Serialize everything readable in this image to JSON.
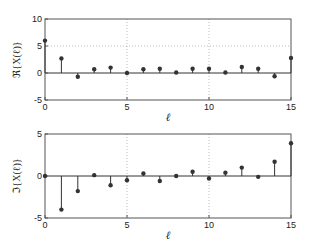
{
  "chart_data": [
    {
      "type": "stem",
      "title": "",
      "xlabel": "ℓ",
      "ylabel": "ℜ{X(ℓ)}",
      "xlim": [
        0,
        15
      ],
      "ylim": [
        -5,
        10
      ],
      "xticks": [
        0,
        5,
        10,
        15
      ],
      "yticks": [
        -5,
        0,
        5,
        10
      ],
      "grid": true,
      "x": [
        0,
        1,
        2,
        3,
        4,
        5,
        6,
        7,
        8,
        9,
        10,
        11,
        12,
        13,
        14,
        15
      ],
      "values": [
        6.0,
        2.7,
        -0.7,
        0.7,
        1.0,
        0.0,
        0.7,
        0.8,
        0.1,
        0.8,
        0.8,
        0.1,
        1.1,
        0.8,
        -0.6,
        2.8
      ]
    },
    {
      "type": "stem",
      "title": "",
      "xlabel": "ℓ",
      "ylabel": "ℑ{X(ℓ)}",
      "xlim": [
        0,
        15
      ],
      "ylim": [
        -5,
        5
      ],
      "xticks": [
        0,
        5,
        10,
        15
      ],
      "yticks": [
        -5,
        0,
        5
      ],
      "grid": true,
      "x": [
        0,
        1,
        2,
        3,
        4,
        5,
        6,
        7,
        8,
        9,
        10,
        11,
        12,
        13,
        14,
        15
      ],
      "values": [
        0.0,
        -4.0,
        -1.8,
        0.1,
        -1.1,
        -0.5,
        0.3,
        -0.6,
        0.0,
        0.5,
        -0.3,
        0.4,
        1.0,
        -0.1,
        1.7,
        3.9
      ]
    }
  ],
  "colors": {
    "stem": "#333333",
    "marker": "#333333",
    "axis": "#555555",
    "grid": "#aaaaaa"
  }
}
